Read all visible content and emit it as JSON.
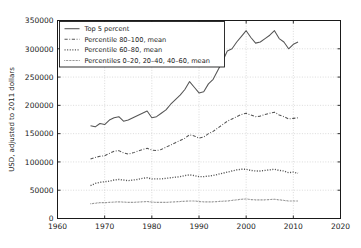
{
  "chart_data": {
    "type": "line",
    "title": "",
    "xlabel": "",
    "ylabel": "USD, adjusted to 2011 dollars",
    "xlim": [
      1960,
      2020
    ],
    "ylim": [
      0,
      350000
    ],
    "xticks": [
      1960,
      1970,
      1980,
      1990,
      2000,
      2010,
      2020
    ],
    "yticks": [
      0,
      50000,
      100000,
      150000,
      200000,
      250000,
      300000,
      350000
    ],
    "ytick_labels": [
      "0",
      "50000",
      "100000",
      "150000",
      "200000",
      "250000",
      "300000",
      "350000"
    ],
    "xtick_labels": [
      "1960",
      "1970",
      "1980",
      "1990",
      "2000",
      "2010",
      "2020"
    ],
    "grid": true,
    "legend_position": "upper left",
    "x": [
      1967,
      1968,
      1969,
      1970,
      1971,
      1972,
      1973,
      1974,
      1975,
      1976,
      1977,
      1978,
      1979,
      1980,
      1981,
      1982,
      1983,
      1984,
      1985,
      1986,
      1987,
      1988,
      1989,
      1990,
      1991,
      1992,
      1993,
      1994,
      1995,
      1996,
      1997,
      1998,
      1999,
      2000,
      2001,
      2002,
      2003,
      2004,
      2005,
      2006,
      2007,
      2008,
      2009,
      2010,
      2011
    ],
    "series": [
      {
        "name": "Top 5 percent",
        "style": "solid",
        "values": [
          164000,
          162000,
          168000,
          166000,
          174000,
          178000,
          180000,
          172000,
          174000,
          178000,
          182000,
          186000,
          190000,
          178000,
          180000,
          186000,
          192000,
          202000,
          210000,
          218000,
          228000,
          242000,
          232000,
          222000,
          224000,
          238000,
          246000,
          262000,
          278000,
          296000,
          300000,
          312000,
          322000,
          332000,
          320000,
          310000,
          312000,
          318000,
          324000,
          332000,
          318000,
          312000,
          300000,
          308000,
          312000
        ]
      },
      {
        "name": "Percentile 80–100, mean",
        "style": "dashdot",
        "values": [
          105000,
          108000,
          110000,
          111000,
          115000,
          119000,
          120000,
          116000,
          114000,
          116000,
          119000,
          122000,
          124000,
          121000,
          120000,
          122000,
          126000,
          130000,
          134000,
          138000,
          142000,
          148000,
          146000,
          142000,
          144000,
          150000,
          154000,
          160000,
          166000,
          172000,
          176000,
          180000,
          184000,
          186000,
          183000,
          180000,
          181000,
          184000,
          186000,
          188000,
          183000,
          180000,
          176000,
          177000,
          178000
        ]
      },
      {
        "name": "Percentile 60–80, mean",
        "style": "dotted-wide",
        "values": [
          58000,
          62000,
          64000,
          65000,
          66000,
          68000,
          69000,
          68000,
          67000,
          68000,
          69000,
          71000,
          72000,
          70000,
          70000,
          70000,
          71000,
          72000,
          73000,
          74000,
          76000,
          77000,
          76000,
          74000,
          74000,
          75000,
          76000,
          78000,
          80000,
          82000,
          84000,
          86000,
          87000,
          87000,
          85000,
          84000,
          84000,
          85000,
          86000,
          87000,
          85000,
          84000,
          81000,
          82000,
          80000
        ]
      },
      {
        "name": "Percentiles 0–20, 20–40, 40–60, mean",
        "style": "dotted-fine",
        "values": [
          26000,
          27000,
          28000,
          28000,
          28500,
          29000,
          29500,
          29000,
          28500,
          28500,
          29000,
          29500,
          30000,
          29000,
          28500,
          28500,
          28500,
          29000,
          29500,
          30000,
          30500,
          31000,
          31000,
          30000,
          29500,
          29500,
          29500,
          30000,
          30500,
          31000,
          32000,
          33000,
          34000,
          34500,
          33500,
          33000,
          33000,
          33000,
          33500,
          34000,
          33000,
          32000,
          31000,
          31000,
          31000
        ]
      }
    ]
  },
  "legend": {
    "entries": [
      {
        "label": "Top 5 percent"
      },
      {
        "label": "Percentile 80–100, mean"
      },
      {
        "label": "Percentile 60–80, mean"
      },
      {
        "label": "Percentiles 0–20, 20–40, 40–60, mean"
      }
    ]
  },
  "colors": {
    "line": "#555555",
    "axis": "#1a1a1a",
    "grid": "#cccccc",
    "background": "#ffffff"
  }
}
